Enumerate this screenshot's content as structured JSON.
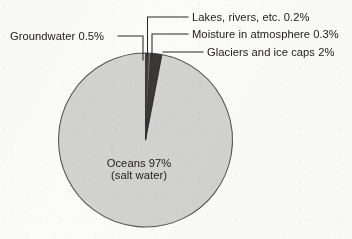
{
  "chart_data": {
    "type": "pie",
    "xlabel": "",
    "ylabel": "",
    "legend_position": "none",
    "grid": false,
    "total_percent": 100,
    "categories": [
      "Oceans (salt water)",
      "Glaciers and ice caps",
      "Groundwater",
      "Moisture in atmosphere",
      "Lakes, rivers, etc."
    ],
    "values": [
      97,
      2,
      0.5,
      0.3,
      0.2
    ],
    "units": "percent",
    "slices": [
      {
        "name": "Oceans (salt water)",
        "label": "Oceans 97%",
        "sublabel": "(salt water)",
        "value": 97,
        "value_text": "97%",
        "color": "#d2d2d0",
        "label_placement": "inside"
      },
      {
        "name": "Glaciers and ice caps",
        "label": "Glaciers and ice caps 2%",
        "value": 2,
        "value_text": "2%",
        "color": "#3b3936",
        "label_placement": "outside-right"
      },
      {
        "name": "Groundwater",
        "label": "Groundwater 0.5%",
        "value": 0.5,
        "value_text": "0.5%",
        "color": "#6e6c69",
        "label_placement": "outside-left"
      },
      {
        "name": "Moisture in atmosphere",
        "label": "Moisture in atmosphere 0.3%",
        "value": 0.3,
        "value_text": "0.3%",
        "color": "#4a4845",
        "label_placement": "outside-right"
      },
      {
        "name": "Lakes, rivers, etc.",
        "label": "Lakes, rivers, etc. 0.2%",
        "value": 0.2,
        "value_text": "0.2%",
        "color": "#8a8885",
        "label_placement": "outside-right"
      }
    ],
    "annotations": [
      "Groundwater 0.5%",
      "Lakes, rivers, etc. 0.2%",
      "Moisture in atmosphere 0.3%",
      "Glaciers and ice caps 2%",
      "Oceans 97%",
      "(salt water)"
    ]
  },
  "labels": {
    "groundwater": "Groundwater 0.5%",
    "lakes": "Lakes, rivers, etc. 0.2%",
    "moisture": "Moisture in atmosphere 0.3%",
    "glaciers": "Glaciers and ice caps 2%",
    "oceans_line1": "Oceans 97%",
    "oceans_line2": "(salt water)"
  },
  "colors": {
    "background": "#fbfbfa",
    "ocean_slice": "#d2d2d0",
    "slice_outline": "#55534f",
    "text": "#23211f",
    "leader_line": "#2a2825",
    "glaciers_slice": "#3b3936",
    "groundwater_slice": "#6e6c69",
    "moisture_slice": "#4a4845",
    "lakes_slice": "#8a8885"
  }
}
